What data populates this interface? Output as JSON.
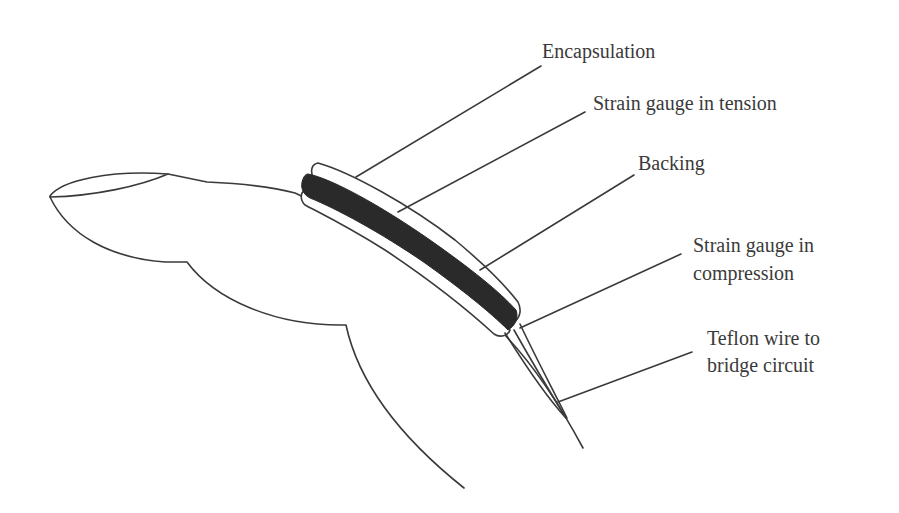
{
  "figure": {
    "labels": {
      "encapsulation": "Encapsulation",
      "tension": "Strain gauge in tension",
      "backing": "Backing",
      "compression_line1": "Strain gauge in",
      "compression_line2": "compression",
      "wire_line1": "Teflon wire to",
      "wire_line2": "bridge circuit"
    },
    "colors": {
      "line": "#3a3a3a",
      "gauge_fill": "#2a2a2a",
      "background": "#ffffff"
    }
  }
}
